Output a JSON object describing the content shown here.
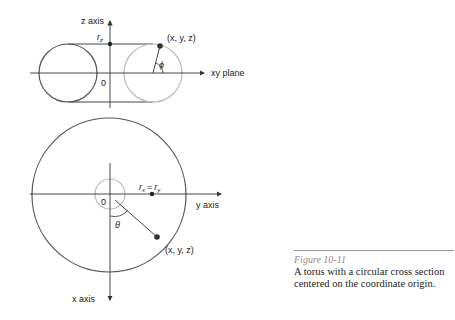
{
  "top_diagram": {
    "z_axis_label": "z axis",
    "plane_label": "xy plane",
    "rz_label": "r",
    "rz_sub": "z",
    "origin_label": "0",
    "point_label": "(x, y, z)",
    "angle_label": "ϕ"
  },
  "bottom_diagram": {
    "y_axis_label": "y axis",
    "x_axis_label": "x axis",
    "radius_label_rx": "r",
    "radius_sub_x": "x",
    "radius_eq": "=",
    "radius_label_ry": "r",
    "radius_sub_y": "y",
    "origin_label": "0",
    "point_label": "(x, y, z)",
    "angle_label": "θ"
  },
  "caption": {
    "figure_label": "Figure 10-11",
    "text": "A torus with a circular cross section centered on the coordinate origin."
  },
  "colors": {
    "line_dark": "#555555",
    "line_gray": "#b8b8b8",
    "caption_label": "#9a8a80"
  }
}
